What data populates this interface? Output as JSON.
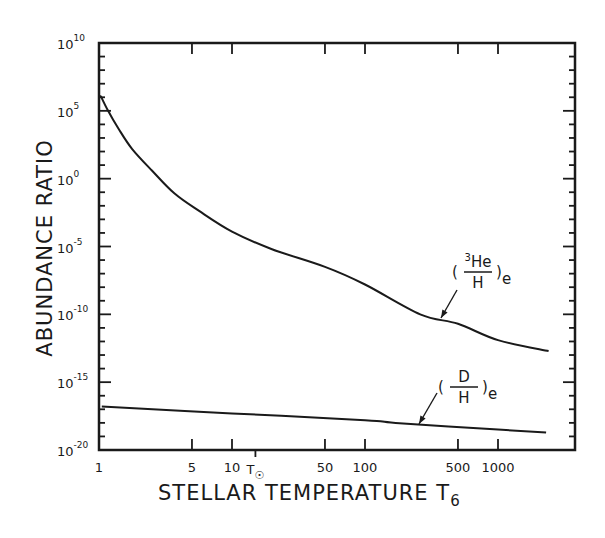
{
  "chart_data": {
    "type": "line",
    "title": "",
    "xlabel": "STELLAR TEMPERATURE T6",
    "xlabel_main": "STELLAR  TEMPERATURE  T",
    "xlabel_sub": "6",
    "ylabel": "ABUNDANCE  RATIO",
    "xscale": "log",
    "yscale": "log",
    "xlim": [
      1,
      3800
    ],
    "ylim": [
      1e-20,
      10000000000.0
    ],
    "grid": false,
    "legend": "inline annotations with arrows",
    "x_ticks": [
      {
        "value": 1,
        "label": "1"
      },
      {
        "value": 5,
        "label": "5"
      },
      {
        "value": 10,
        "label": "10"
      },
      {
        "value": 50,
        "label": "50"
      },
      {
        "value": 100,
        "label": "100"
      },
      {
        "value": 500,
        "label": "500"
      },
      {
        "value": 1000,
        "label": "1000"
      }
    ],
    "x_special_tick": {
      "value": 15,
      "label": "T",
      "sub": "☉",
      "note": "solar central temperature marker"
    },
    "y_ticks": [
      {
        "exp": 10,
        "label": "10",
        "sup": "10"
      },
      {
        "exp": 5,
        "label": "10",
        "sup": "5"
      },
      {
        "exp": 0,
        "label": "10",
        "sup": "0"
      },
      {
        "exp": -5,
        "label": "10",
        "sup": "-5"
      },
      {
        "exp": -10,
        "label": "10",
        "sup": "-10"
      },
      {
        "exp": -15,
        "label": "10",
        "sup": "-15"
      },
      {
        "exp": -20,
        "label": "10",
        "sup": "-20"
      }
    ],
    "series": [
      {
        "name": "(3He/H)e",
        "label_num_sup": "3",
        "label_num": "He",
        "label_den": "H",
        "label_sub": "e",
        "points_log10": [
          {
            "T": 1.03,
            "log_ratio": 6.1
          },
          {
            "T": 1.17,
            "log_ratio": 5.0
          },
          {
            "T": 1.4,
            "log_ratio": 3.7
          },
          {
            "T": 1.77,
            "log_ratio": 2.2
          },
          {
            "T": 2.5,
            "log_ratio": 0.6
          },
          {
            "T": 3.7,
            "log_ratio": -1.1
          },
          {
            "T": 5.7,
            "log_ratio": -2.4
          },
          {
            "T": 10,
            "log_ratio": -3.9
          },
          {
            "T": 20,
            "log_ratio": -5.2
          },
          {
            "T": 50,
            "log_ratio": -6.5
          },
          {
            "T": 100,
            "log_ratio": -7.8
          },
          {
            "T": 260,
            "log_ratio": -10.0
          },
          {
            "T": 500,
            "log_ratio": -10.7
          },
          {
            "T": 1000,
            "log_ratio": -11.9
          },
          {
            "T": 2400,
            "log_ratio": -12.7
          }
        ]
      },
      {
        "name": "(D/H)e",
        "label_num": "D",
        "label_den": "H",
        "label_sub": "e",
        "points_log10": [
          {
            "T": 1.05,
            "log_ratio": -16.8
          },
          {
            "T": 10,
            "log_ratio": -17.3
          },
          {
            "T": 100,
            "log_ratio": -17.8
          },
          {
            "T": 170,
            "log_ratio": -18.0
          },
          {
            "T": 1000,
            "log_ratio": -18.5
          },
          {
            "T": 2300,
            "log_ratio": -18.7
          }
        ]
      }
    ]
  }
}
